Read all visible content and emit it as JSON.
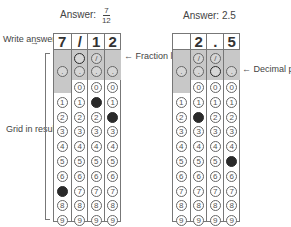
{
  "left": {
    "title": "Answer:",
    "fraction": {
      "num": "7",
      "den": "12"
    },
    "boxes": [
      "7",
      "/",
      "1",
      "2"
    ],
    "filled": {
      "slash": [
        false,
        true,
        false,
        false
      ],
      "dot": [
        false,
        false,
        false,
        false
      ],
      "digit": [
        7,
        null,
        1,
        2
      ]
    },
    "has_slash": [
      false,
      true,
      true,
      false
    ]
  },
  "right": {
    "title": "Answer: 2.5",
    "boxes": [
      "",
      "2",
      ".",
      "5"
    ],
    "filled": {
      "slash": [
        false,
        false,
        false,
        false
      ],
      "dot": [
        false,
        false,
        true,
        false
      ],
      "digit": [
        null,
        2,
        null,
        5
      ]
    },
    "has_slash": [
      false,
      true,
      true,
      false
    ]
  },
  "labels": {
    "write_answer": "Write answer in boxes.",
    "fraction_line": "Fraction line",
    "grid_in": "Grid in result.",
    "decimal_point": "Decimal point"
  },
  "digits": [
    "0",
    "1",
    "2",
    "3",
    "4",
    "5",
    "6",
    "7",
    "8",
    "9"
  ]
}
